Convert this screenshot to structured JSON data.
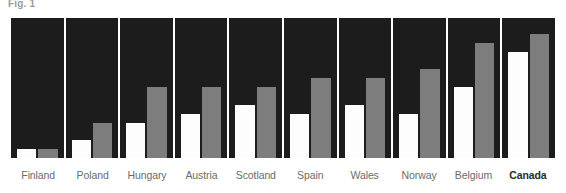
{
  "figure": {
    "caption_fragment": "Fig. 1"
  },
  "chart_data": {
    "type": "bar",
    "title": "",
    "subtitle": "",
    "xlabel": "",
    "ylabel": "",
    "ylim": [
      0,
      14
    ],
    "grid": false,
    "legend_position": "none",
    "highlight_category": "Canada",
    "background_color": "#1c1c1c",
    "series_colors": [
      "#fdfdfd",
      "#7d7d7d"
    ],
    "categories": [
      "Finland",
      "Poland",
      "Hungary",
      "Austria",
      "Scotland",
      "Spain",
      "Wales",
      "Norway",
      "Belgium",
      "Canada"
    ],
    "series": [
      {
        "name": "series-1",
        "color": "#fdfdfd",
        "values": [
          1,
          2,
          4,
          5,
          6,
          5,
          6,
          5,
          8,
          12
        ]
      },
      {
        "name": "series-2",
        "color": "#7d7d7d",
        "values": [
          1,
          4,
          8,
          8,
          8,
          9,
          9,
          10,
          13,
          14
        ]
      }
    ]
  }
}
